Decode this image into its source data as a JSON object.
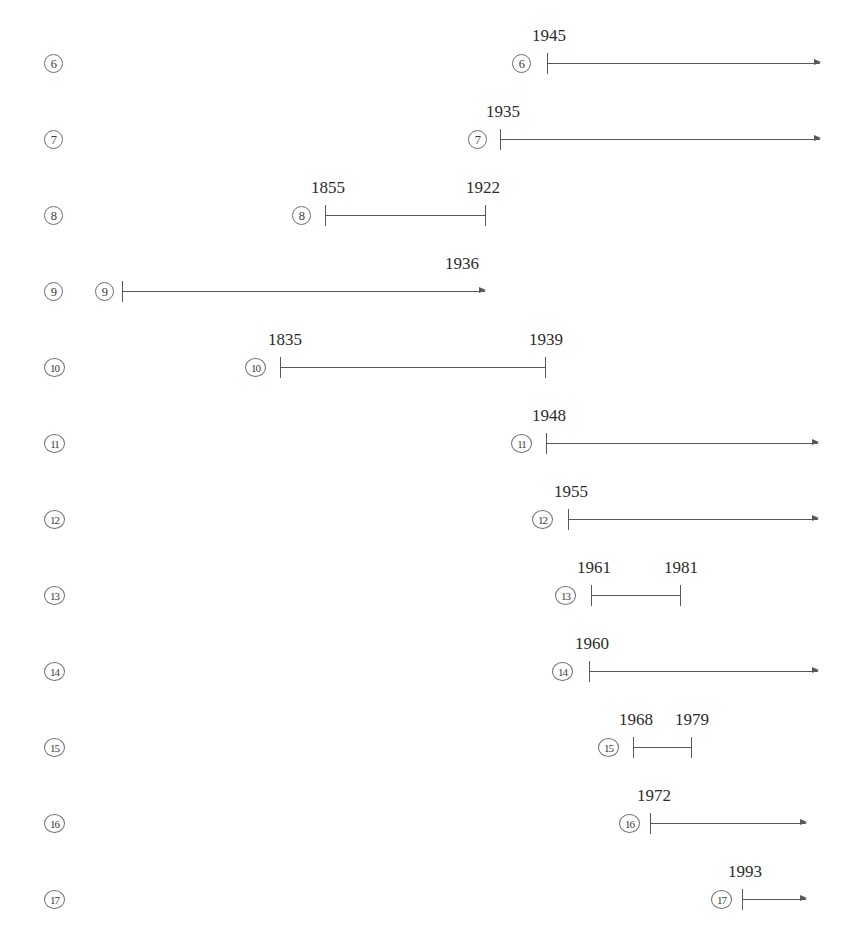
{
  "document": {
    "top_strip_text": "",
    "kind": "timeline-chart"
  },
  "chart_data": {
    "type": "bar",
    "title": "",
    "xlabel": "",
    "ylabel": "",
    "orientation": "horizontal",
    "categories": [
      "6",
      "7",
      "8",
      "9",
      "10",
      "11",
      "12",
      "13",
      "14",
      "15",
      "16",
      "17"
    ],
    "rows": [
      {
        "index_label": "6",
        "marker": "⑥",
        "start_year": "1945",
        "end_year": "",
        "open_ended": true,
        "labels": [
          "1945"
        ],
        "row_circle_x": 512,
        "start_x": 547,
        "end_x": 820,
        "label_x": [
          549
        ]
      },
      {
        "index_label": "7",
        "marker": "⑦",
        "start_year": "1935",
        "end_year": "",
        "open_ended": true,
        "labels": [
          "1935"
        ],
        "row_circle_x": 468,
        "start_x": 500,
        "end_x": 820,
        "label_x": [
          503
        ]
      },
      {
        "index_label": "8",
        "marker": "⑧",
        "start_year": "1855",
        "end_year": "1922",
        "open_ended": false,
        "labels": [
          "1855",
          "1922"
        ],
        "row_circle_x": 292,
        "start_x": 325,
        "end_x": 485,
        "label_x": [
          328,
          483
        ]
      },
      {
        "index_label": "9",
        "marker": "⑨",
        "start_year": "",
        "end_year": "1936",
        "open_ended": true,
        "labels": [
          "1936"
        ],
        "row_circle_x": 95,
        "start_x": 122,
        "end_x": 485,
        "label_x": [
          462
        ]
      },
      {
        "index_label": "10",
        "marker": "⑩",
        "start_year": "1835",
        "end_year": "1939",
        "open_ended": false,
        "labels": [
          "1835",
          "1939"
        ],
        "row_circle_x": 245,
        "start_x": 280,
        "end_x": 545,
        "label_x": [
          285,
          546
        ]
      },
      {
        "index_label": "11",
        "marker": "⑪",
        "start_year": "1948",
        "end_year": "",
        "open_ended": true,
        "labels": [
          "1948"
        ],
        "row_circle_x": 511,
        "start_x": 546,
        "end_x": 818,
        "label_x": [
          549
        ]
      },
      {
        "index_label": "12",
        "marker": "⑫",
        "start_year": "1955",
        "end_year": "",
        "open_ended": true,
        "labels": [
          "1955"
        ],
        "row_circle_x": 532,
        "start_x": 568,
        "end_x": 818,
        "label_x": [
          571
        ]
      },
      {
        "index_label": "13",
        "marker": "⑬",
        "start_year": "1961",
        "end_year": "1981",
        "open_ended": false,
        "labels": [
          "1961",
          "1981"
        ],
        "row_circle_x": 555,
        "start_x": 591,
        "end_x": 680,
        "label_x": [
          594,
          681
        ]
      },
      {
        "index_label": "14",
        "marker": "⑭",
        "start_year": "1960",
        "end_year": "",
        "open_ended": true,
        "labels": [
          "1960"
        ],
        "row_circle_x": 552,
        "start_x": 589,
        "end_x": 818,
        "label_x": [
          592
        ]
      },
      {
        "index_label": "15",
        "marker": "⑮",
        "start_year": "1968",
        "end_year": "1979",
        "open_ended": false,
        "labels": [
          "1968",
          "1979"
        ],
        "row_circle_x": 598,
        "start_x": 633,
        "end_x": 691,
        "label_x": [
          636,
          692
        ]
      },
      {
        "index_label": "16",
        "marker": "⑯",
        "start_year": "1972",
        "end_year": "",
        "open_ended": true,
        "labels": [
          "1972"
        ],
        "row_circle_x": 619,
        "start_x": 650,
        "end_x": 806,
        "label_x": [
          654
        ]
      },
      {
        "index_label": "17",
        "marker": "⑰",
        "start_year": "1993",
        "end_year": "",
        "open_ended": true,
        "labels": [
          "1993"
        ],
        "row_circle_x": 711,
        "start_x": 742,
        "end_x": 806,
        "label_x": [
          745
        ]
      }
    ],
    "legend": [],
    "grid": false
  },
  "left_index_column": {
    "x": 44,
    "items": [
      "6",
      "7",
      "8",
      "9",
      "10",
      "11",
      "12",
      "13",
      "14",
      "15",
      "16",
      "17"
    ]
  },
  "colors": {
    "line": "#57575c",
    "text": "#2b2b2b",
    "circle_border": "#6e6e73",
    "background": "#ffffff"
  }
}
